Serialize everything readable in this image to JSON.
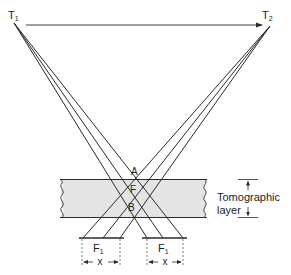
{
  "labels": {
    "tube_start": "T",
    "tube_start_sub": "1",
    "tube_end": "T",
    "tube_end_sub": "2",
    "point_a": "A",
    "point_f": "F",
    "point_b": "B",
    "layer_line1": "Tomographic",
    "layer_line2": "layer",
    "film_left": "F",
    "film_left_sub": "1",
    "film_right": "F",
    "film_right_sub": "1",
    "shift_left": "x",
    "shift_right": "x"
  },
  "colors": {
    "line": "#2a2a2a",
    "layer_fill": "#e4e4e4",
    "text": "#222222"
  }
}
